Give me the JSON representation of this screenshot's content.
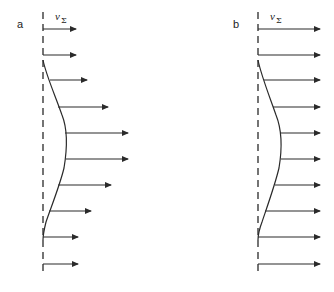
{
  "figure": {
    "stroke_color": "#2a2a2a",
    "panels": [
      {
        "id": "a",
        "label": "a",
        "velocity_label": "v",
        "velocity_subscript": "Σ",
        "axis_x": 43,
        "axis_y_top": 12,
        "axis_y_bottom": 274,
        "label_pos": [
          17,
          28
        ],
        "vlabel_pos": [
          55,
          20
        ],
        "arrows": [
          {
            "y": 29,
            "x_start": 43,
            "x_end": 76
          },
          {
            "y": 55,
            "x_start": 43,
            "x_end": 76
          },
          {
            "y": 80,
            "x_start": 50,
            "x_end": 87
          },
          {
            "y": 107,
            "x_start": 58,
            "x_end": 108
          },
          {
            "y": 133,
            "x_start": 65,
            "x_end": 128
          },
          {
            "y": 159,
            "x_start": 66,
            "x_end": 128
          },
          {
            "y": 185,
            "x_start": 58,
            "x_end": 111
          },
          {
            "y": 211,
            "x_start": 49,
            "x_end": 91
          },
          {
            "y": 237,
            "x_start": 43,
            "x_end": 78
          },
          {
            "y": 264,
            "x_start": 43,
            "x_end": 78
          }
        ],
        "curve": "M43,60 C46,75 55,95 62,115 C68,130 67,150 64,168 C60,185 50,210 46,222 C44,230 43,234 43,240"
      },
      {
        "id": "b",
        "label": "b",
        "velocity_label": "v",
        "velocity_subscript": "Σ",
        "axis_x": 258,
        "axis_y_top": 12,
        "axis_y_bottom": 274,
        "label_pos": [
          233,
          28
        ],
        "vlabel_pos": [
          270,
          20
        ],
        "arrows": [
          {
            "y": 29,
            "x_start": 258,
            "x_end": 320
          },
          {
            "y": 55,
            "x_start": 258,
            "x_end": 320
          },
          {
            "y": 80,
            "x_start": 264,
            "x_end": 320
          },
          {
            "y": 107,
            "x_start": 273,
            "x_end": 320
          },
          {
            "y": 133,
            "x_start": 280,
            "x_end": 320
          },
          {
            "y": 159,
            "x_start": 281,
            "x_end": 320
          },
          {
            "y": 185,
            "x_start": 275,
            "x_end": 320
          },
          {
            "y": 211,
            "x_start": 265,
            "x_end": 320
          },
          {
            "y": 237,
            "x_start": 258,
            "x_end": 320
          },
          {
            "y": 264,
            "x_start": 258,
            "x_end": 320
          }
        ],
        "curve": "M258,60 C261,75 269,95 276,115 C282,130 282,150 279,168 C275,185 266,210 262,222 C259,230 258,234 258,240"
      }
    ]
  }
}
